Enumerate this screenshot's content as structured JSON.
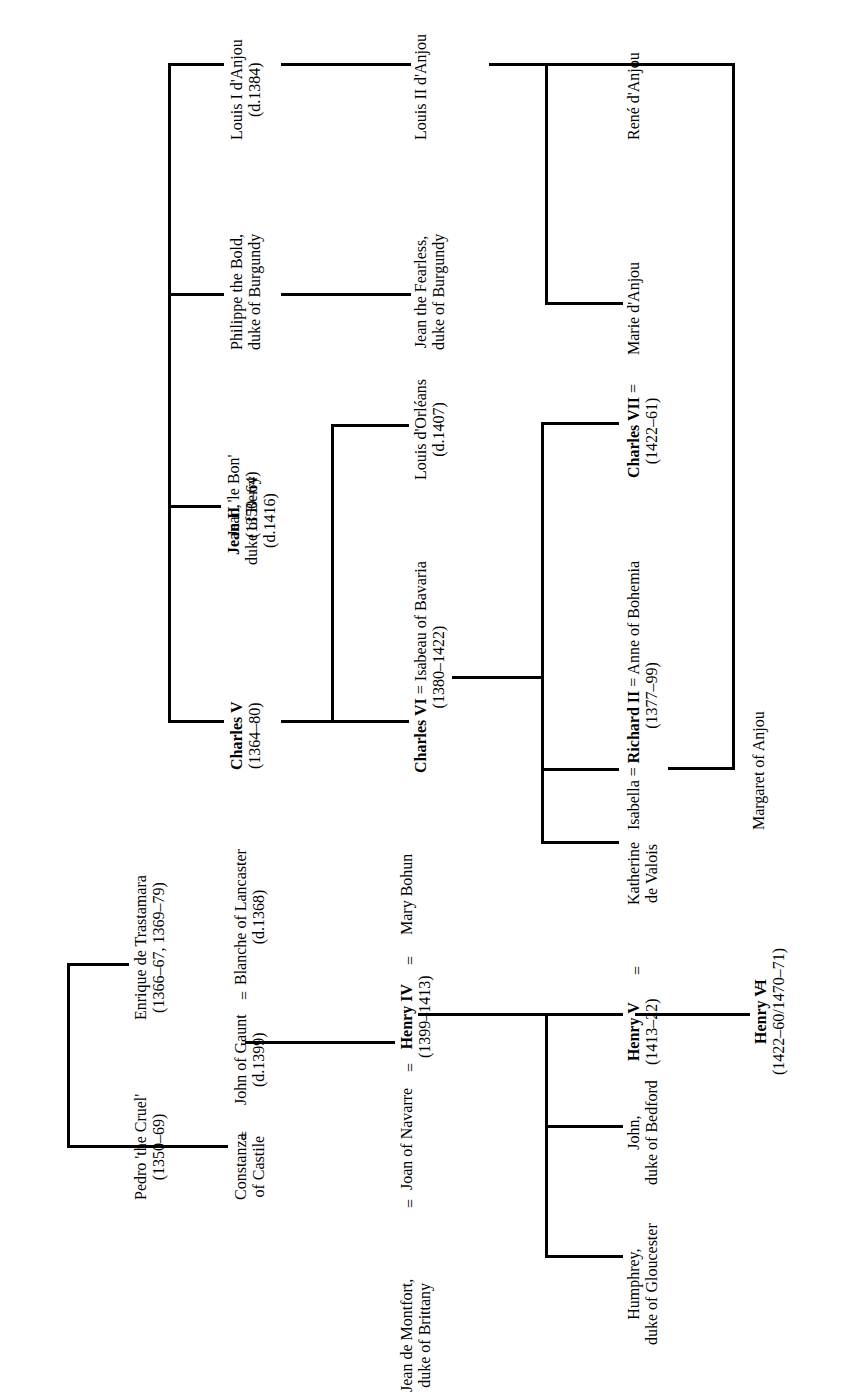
{
  "diagram": {
    "orientation": "rotated-90-ccw",
    "line_color": "#000000",
    "background": "#ffffff"
  },
  "people": {
    "jean2": {
      "name": "Jean II 'le Bon'",
      "name_bold": "Jean II",
      "name_rest": " 'le Bon'",
      "dates": "(1350–64)"
    },
    "charles5": {
      "name": "Charles V",
      "dates": "(1364–80)"
    },
    "jean_berry": {
      "line1": "Jean,",
      "line2": "duke of Berry",
      "dates": "(d.1416)"
    },
    "philippe": {
      "line1": "Philippe the Bold,",
      "line2": "duke of Burgundy"
    },
    "louis1": {
      "name": "Louis I d'Anjou",
      "dates": "(d.1384)"
    },
    "louis2": {
      "name": "Louis II d'Anjou"
    },
    "jean_fearless": {
      "line1": "Jean the Fearless,",
      "line2": "duke of Burgundy"
    },
    "louis_orleans": {
      "name": "Louis d'Orléans",
      "dates": "(d.1407)"
    },
    "charles6": {
      "name_bold": "Charles VI",
      "spouse_sep": " = ",
      "spouse": "Isabeau of Bavaria",
      "dates": "(1380–1422)"
    },
    "rene": {
      "name": "René d'Anjou"
    },
    "marie": {
      "name": "Marie d'Anjou"
    },
    "charles7": {
      "name_bold": "Charles VII",
      "spouse_sep": "  =  ",
      "spouse": "Marie d'Anjou",
      "dates": "(1422–61)"
    },
    "richard2": {
      "prefix": "Isabella = ",
      "name_bold": "Richard II",
      "spouse_sep": " = ",
      "spouse": "Anne of Bohemia",
      "dates": "(1377–99)"
    },
    "isabella": {
      "name": "Isabella"
    },
    "katherine": {
      "line1": "Katherine",
      "line2": "de Valois"
    },
    "margaret": {
      "name": "Margaret of Anjou"
    },
    "pedro": {
      "name": "Pedro 'the Cruel'",
      "dates": "(1350–69)"
    },
    "enrique": {
      "name": "Enrique de Trastamara",
      "dates": "(1366–67, 1369–79)"
    },
    "constanza": {
      "line1": "Constanza",
      "line2": "of Castile"
    },
    "john_gaunt": {
      "name": "John of Gaunt",
      "dates": "(d.1399)"
    },
    "blanche": {
      "name": "Blanche of Lancaster",
      "dates": "(d.1368)"
    },
    "jean_montfort": {
      "line1": "Jean de Montfort,",
      "line2": "duke of Brittany"
    },
    "joan_navarre": {
      "name": "Joan of Navarre"
    },
    "henry4": {
      "name_bold": "Henry IV",
      "dates": "(1399–1413)"
    },
    "mary_bohun": {
      "name": "Mary Bohun"
    },
    "henry5": {
      "name_bold": "Henry V",
      "dates": "(1413–22)"
    },
    "john_bedford": {
      "line1": "John,",
      "line2": "duke of Bedford"
    },
    "humphrey": {
      "line1": "Humphrey,",
      "line2": "duke of Gloucester"
    },
    "henry6": {
      "name_bold": "Henry VI",
      "dates": "(1422–60/1470–71)"
    }
  },
  "marriage_symbol": "=",
  "labels": {
    "row_constanza_eq": "=",
    "row_gaunt_eq": "=",
    "row_montfort_eq": "=",
    "row_joan_eq": "=",
    "row_henry4_eq": "=",
    "row_henry5_eq": "=",
    "row_henry6_eq": "=",
    "row_charles7_eq": "="
  }
}
